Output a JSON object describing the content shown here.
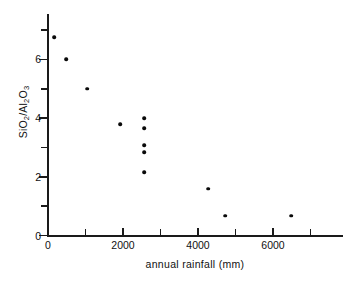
{
  "chart_data": {
    "type": "scatter",
    "title": "",
    "xlabel": "annual rainfall (mm)",
    "ylabel": "SiO2/Al2O3",
    "ylabel_parts": [
      "SiO",
      "2",
      "/Al",
      "2",
      "O",
      "3"
    ],
    "xlim": [
      0,
      7900
    ],
    "ylim": [
      0,
      7.5
    ],
    "grid": false,
    "legend": null,
    "x_major_ticks": [
      0,
      2000,
      4000,
      6000
    ],
    "x_minor_ticks": [
      1000,
      3000,
      5000,
      7000
    ],
    "x_tick_labels": [
      "0",
      "2000",
      "4000",
      "6000"
    ],
    "y_major_ticks": [
      0,
      2,
      4,
      6
    ],
    "y_minor_ticks": [
      1,
      3,
      5,
      7
    ],
    "y_tick_labels": [
      "0",
      "2",
      "4",
      "6"
    ],
    "marker": "filled-circle",
    "marker_color": "#0a0a0a",
    "points": [
      {
        "x": 160,
        "y": 6.75
      },
      {
        "x": 480,
        "y": 6.0
      },
      {
        "x": 1040,
        "y": 5.0
      },
      {
        "x": 1930,
        "y": 3.8
      },
      {
        "x": 2570,
        "y": 3.99
      },
      {
        "x": 2570,
        "y": 3.65
      },
      {
        "x": 2570,
        "y": 3.07
      },
      {
        "x": 2570,
        "y": 2.83
      },
      {
        "x": 2570,
        "y": 2.15
      },
      {
        "x": 4270,
        "y": 1.6
      },
      {
        "x": 4730,
        "y": 0.68
      },
      {
        "x": 6480,
        "y": 0.68
      }
    ]
  },
  "figure": {
    "background_color": "#ffffff",
    "axis_color": "#1a1a1a"
  }
}
